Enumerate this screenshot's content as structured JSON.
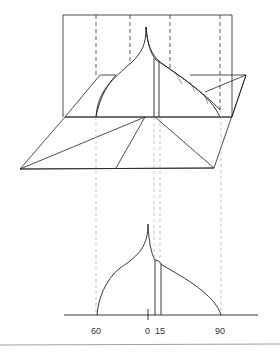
{
  "diagram": {
    "type": "descriptive-geometry-projection",
    "colors": {
      "line": "#222222",
      "dashed_top": "#333333",
      "dashed_bottom": "#aaaaaa",
      "hatch": "#555555",
      "footer_rule": "#888888"
    },
    "top_view": {
      "description": "Vertical plane rectangle with onion-dome curved surface, intersecting a ground parallelogram with fold lines"
    },
    "bottom_view": {
      "description": "Profile of curved surface on a baseline with angle labels",
      "axis_labels": [
        "60",
        "0",
        "15",
        "90"
      ]
    }
  }
}
